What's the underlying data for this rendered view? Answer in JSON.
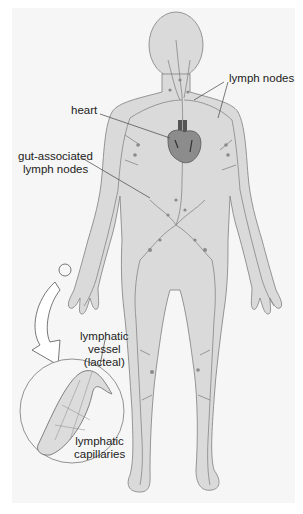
{
  "figure": {
    "labels": {
      "lymph_nodes": "lymph nodes",
      "heart": "heart",
      "gut_nodes_line1": "gut-associated",
      "gut_nodes_line2": "lymph nodes",
      "vessel_line1": "lymphatic",
      "vessel_line2": "vessel",
      "vessel_line3": "(lacteal)",
      "capillaries_line1": "lymphatic",
      "capillaries_line2": "capillaries"
    },
    "colors": {
      "background_panel": "#f6f6f6",
      "body_fill": "#d9d9d9",
      "outline": "#8a8a8a",
      "heart_fill": "#8c8c8c",
      "vessel": "#777777"
    }
  }
}
